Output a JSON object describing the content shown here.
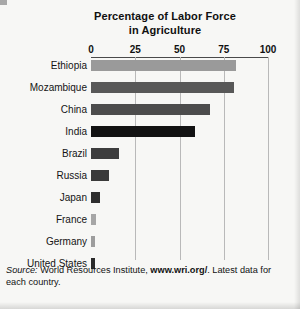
{
  "chart_data": {
    "type": "bar",
    "orientation": "horizontal",
    "title": "Percentage of Labor Force in Agriculture",
    "title_line1": "Percentage of Labor Force",
    "title_line2": "in Agriculture",
    "xlabel": "",
    "ylabel": "",
    "xlim": [
      0,
      100
    ],
    "ticks": [
      0,
      25,
      50,
      75,
      100
    ],
    "tick_labels": [
      "0",
      "25",
      "50",
      "75",
      "100"
    ],
    "grid": "vertical gridlines at 25, 50, 75, 100",
    "legend": "none",
    "categories": [
      "Ethiopia",
      "Mozambique",
      "China",
      "India",
      "Brazil",
      "Russia",
      "Japan",
      "France",
      "Germany",
      "United States"
    ],
    "values": [
      82,
      81,
      67,
      59,
      16,
      10,
      5,
      3,
      2,
      2
    ],
    "bar_colors": [
      "#9a9a9a",
      "#585858",
      "#4c4c4c",
      "#121212",
      "#3d3d3d",
      "#3a3a3a",
      "#2e2e2e",
      "#a6a6a6",
      "#9d9d9d",
      "#2a2a2a"
    ]
  },
  "source": {
    "prefix": "Source:",
    "body_before_url": " World Resources Institute, ",
    "url": "www.wri.org/",
    "body_after_url": ". Latest data for each country."
  }
}
